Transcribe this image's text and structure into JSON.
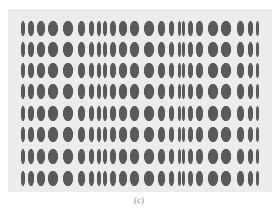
{
  "figure": {
    "caption": "(c)",
    "colors": {
      "background": "#ececec",
      "ellipse": "#5a5a5a"
    },
    "rows_y": [
      28,
      49,
      70,
      91,
      113,
      134,
      156,
      178
    ],
    "ellipse_height": 15,
    "columns": [
      {
        "x": 23,
        "w": 4
      },
      {
        "x": 31,
        "w": 6
      },
      {
        "x": 41,
        "w": 8
      },
      {
        "x": 53,
        "w": 10
      },
      {
        "x": 68,
        "w": 10
      },
      {
        "x": 81,
        "w": 7
      },
      {
        "x": 91,
        "w": 5
      },
      {
        "x": 99,
        "w": 4
      },
      {
        "x": 105,
        "w": 4
      },
      {
        "x": 113,
        "w": 6
      },
      {
        "x": 123,
        "w": 8
      },
      {
        "x": 134,
        "w": 9
      },
      {
        "x": 149,
        "w": 10
      },
      {
        "x": 161,
        "w": 7
      },
      {
        "x": 171,
        "w": 5
      },
      {
        "x": 179,
        "w": 3
      },
      {
        "x": 183,
        "w": 3
      },
      {
        "x": 190,
        "w": 5
      },
      {
        "x": 199,
        "w": 7
      },
      {
        "x": 213,
        "w": 10
      },
      {
        "x": 226,
        "w": 10
      },
      {
        "x": 240,
        "w": 7
      },
      {
        "x": 250,
        "w": 5
      },
      {
        "x": 257,
        "w": 3
      }
    ]
  }
}
